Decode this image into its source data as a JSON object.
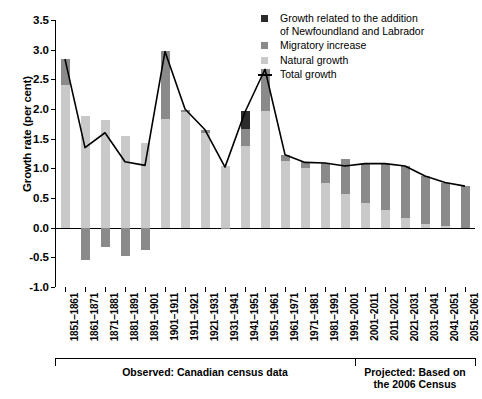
{
  "chart_data": {
    "type": "bar",
    "title": "",
    "xlabel": "",
    "ylabel": "Growth rate (per cent)",
    "ylim": [
      -1.0,
      3.5
    ],
    "yticks": [
      "3.5",
      "3.0",
      "2.5",
      "2.0",
      "1.5",
      "1.0",
      "0.5",
      "0.0",
      "-0.5",
      "-1.0"
    ],
    "ytick_values": [
      3.5,
      3.0,
      2.5,
      2.0,
      1.5,
      1.0,
      0.5,
      0.0,
      -0.5,
      -1.0
    ],
    "grid": false,
    "stacked": true,
    "legend_position": "top-right",
    "categories": [
      "1851–1861",
      "1861–1871",
      "1871–1881",
      "1881–1891",
      "1891–1901",
      "1901–1911",
      "1911–1921",
      "1921–1931",
      "1931–1941",
      "1941–1951",
      "1951–1961",
      "1961–1971",
      "1971–1981",
      "1981–1991",
      "1991–2001",
      "2001–2011",
      "2011–2021",
      "2021–2031",
      "2031–2041",
      "2041–2051",
      "2051–2061"
    ],
    "series": [
      {
        "name": "Natural growth",
        "color": "#c9c9c9",
        "values": [
          2.41,
          1.88,
          1.81,
          1.55,
          1.42,
          1.83,
          1.95,
          1.59,
          1.04,
          1.38,
          1.97,
          1.13,
          1.0,
          0.76,
          0.56,
          0.41,
          0.3,
          0.17,
          0.06,
          0.02,
          0.0
        ]
      },
      {
        "name": "Migratory increase",
        "color": "#8a8a8a",
        "values": [
          0.43,
          -0.55,
          -0.32,
          -0.48,
          -0.38,
          1.14,
          0.04,
          0.05,
          -0.02,
          0.28,
          0.7,
          0.1,
          0.1,
          0.33,
          0.6,
          0.67,
          0.78,
          0.87,
          0.81,
          0.73,
          0.7
        ]
      },
      {
        "name": "Growth related to the addition of Newfoundland and Labrador",
        "color": "#2b2b2b",
        "values": [
          0,
          0,
          0,
          0,
          0,
          0,
          0,
          0,
          0,
          0.3,
          0,
          0,
          0,
          0,
          0,
          0,
          0,
          0,
          0,
          0,
          0
        ]
      }
    ],
    "total_growth": {
      "name": "Total growth",
      "color": "#000000",
      "values": [
        2.84,
        1.35,
        1.6,
        1.11,
        1.05,
        2.97,
        2.0,
        1.65,
        1.02,
        1.95,
        2.67,
        1.23,
        1.1,
        1.09,
        1.04,
        1.08,
        1.08,
        1.04,
        0.87,
        0.76,
        0.7
      ]
    }
  },
  "legend": {
    "items": [
      {
        "label_line1": "Growth related to the addition",
        "label_line2": "of Newfoundland and Labrador",
        "swatch": "#2b2b2b",
        "type": "swatch"
      },
      {
        "label_line1": "Migratory increase",
        "label_line2": "",
        "swatch": "#8a8a8a",
        "type": "swatch"
      },
      {
        "label_line1": "Natural growth",
        "label_line2": "",
        "swatch": "#c9c9c9",
        "type": "swatch"
      },
      {
        "label_line1": "Total growth",
        "label_line2": "",
        "swatch": "#000000",
        "type": "line"
      }
    ]
  },
  "annotations": {
    "observed": "Observed: Canadian census data",
    "projected_line1": "Projected: Based on",
    "projected_line2": "the 2006 Census",
    "observed_span": [
      0,
      15
    ],
    "projected_span": [
      15,
      21
    ]
  }
}
